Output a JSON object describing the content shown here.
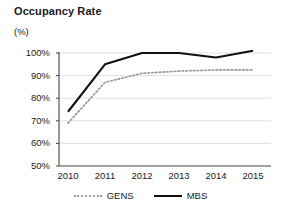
{
  "chart_data": {
    "type": "line",
    "title": "Occupancy Rate",
    "subtitle": "(%)",
    "xlabel": "",
    "ylabel": "(%)",
    "categories": [
      "2010",
      "2011",
      "2012",
      "2013",
      "2014",
      "2015"
    ],
    "series": [
      {
        "name": "GENS",
        "style": "dotted",
        "color": "#9a9a9a",
        "values": [
          69,
          87,
          91,
          92,
          92.5,
          92.5
        ]
      },
      {
        "name": "MBS",
        "style": "solid",
        "color": "#111111",
        "values": [
          74,
          95,
          100,
          100,
          98,
          101
        ]
      }
    ],
    "ylim": [
      50,
      100
    ],
    "ytick_labels": [
      "100%",
      "90%",
      "80%",
      "70%",
      "60%",
      "50%"
    ],
    "ytick_values": [
      100,
      90,
      80,
      70,
      60,
      50
    ],
    "grid": true,
    "legend_position": "bottom"
  },
  "legend": {
    "items": [
      {
        "label": "GENS",
        "swatch": "dotted-line-swatch"
      },
      {
        "label": "MBS",
        "swatch": "solid-line-swatch"
      }
    ]
  },
  "colors": {
    "gens_line": "#9a9a9a",
    "mbs_line": "#111111",
    "axis": "#555555",
    "grid": "#d8d8d8",
    "text": "#1a1a1a",
    "background": "#ffffff"
  }
}
